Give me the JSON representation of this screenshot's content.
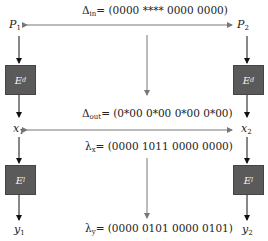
{
  "diagram": {
    "top": {
      "delta_in_label": "Δ",
      "delta_in_sub": "in",
      "delta_in_value": "= (0000 **** 0000 0000)",
      "p1": "P",
      "p1_sub": "1",
      "p2": "P",
      "p2_sub": "2"
    },
    "boxes": {
      "ed_left": {
        "name": "E",
        "sub": "d"
      },
      "ed_right": {
        "name": "E",
        "sub": "d"
      },
      "el_left": {
        "name": "E",
        "sub": "l"
      },
      "el_right": {
        "name": "E",
        "sub": "l"
      }
    },
    "middle": {
      "delta_out_label": "Δ",
      "delta_out_sub": "out",
      "delta_out_value": "= (0*00 0*00 0*00 0*00)",
      "x1": "x",
      "x1_sub": "1",
      "x2": "x",
      "x2_sub": "2",
      "lambda_x_label": "λ",
      "lambda_x_sub": "x",
      "lambda_x_value": "= (0000 1011 0000 0000)"
    },
    "bottom": {
      "y1": "y",
      "y1_sub": "1",
      "y2": "y",
      "y2_sub": "2",
      "lambda_y_label": "λ",
      "lambda_y_sub": "y",
      "lambda_y_value": "= (0000 0101 0000 0101)"
    },
    "colors": {
      "box_fill": "#5a5a5a",
      "arrow_dark": "#111111",
      "arrow_gray": "#777777"
    }
  }
}
